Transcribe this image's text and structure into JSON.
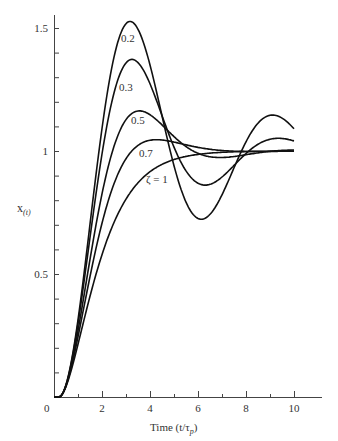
{
  "chart_data": {
    "type": "line",
    "title": "",
    "xlabel": "Time (t/τp)",
    "ylabel": "x(t)",
    "xlim": [
      0,
      11.5
    ],
    "ylim": [
      0,
      1.6
    ],
    "xticks": [
      0,
      2,
      4,
      6,
      8,
      10
    ],
    "xtick_labels": [
      "0",
      "2",
      "4",
      "6",
      "8",
      "10"
    ],
    "yticks": [
      0.5,
      1,
      1.5
    ],
    "ytick_labels": [
      "0.5",
      "1",
      "1.5"
    ],
    "grid": false,
    "legend": "inline labels",
    "series": [
      {
        "name": "0.2",
        "zeta": 0.2,
        "peak": 1.52,
        "peak_t": 3.0,
        "min": 0.72,
        "min_t": 6.3,
        "end_value": 1.14
      },
      {
        "name": "0.3",
        "zeta": 0.3,
        "peak": 1.38,
        "peak_t": 3.2,
        "min": 0.85,
        "min_t": 6.5,
        "end_value": 1.06
      },
      {
        "name": "0.5",
        "zeta": 0.5,
        "peak": 1.17,
        "peak_t": 3.3,
        "end_value": 1.01
      },
      {
        "name": "0.7",
        "zeta": 0.7,
        "peak": 1.05,
        "peak_t": 4.3,
        "end_value": 1.0
      },
      {
        "name": "ζ = 1",
        "zeta": 1.0,
        "end_value": 1.0
      }
    ],
    "x": [
      0,
      1,
      2,
      3,
      4,
      5,
      6,
      7,
      8,
      9,
      10
    ],
    "series_values": {
      "0.2": [
        0,
        0.4,
        1.15,
        1.52,
        1.35,
        0.95,
        0.73,
        0.8,
        1.05,
        1.18,
        1.14
      ],
      "0.3": [
        0,
        0.37,
        1.05,
        1.37,
        1.28,
        0.98,
        0.85,
        0.92,
        1.04,
        1.08,
        1.05
      ],
      "0.5": [
        0,
        0.33,
        0.9,
        1.15,
        1.12,
        1.03,
        0.99,
        1.0,
        1.01,
        1.01,
        1.01
      ],
      "0.7": [
        0,
        0.3,
        0.78,
        1.0,
        1.05,
        1.03,
        1.01,
        1.0,
        1.0,
        1.0,
        1.01
      ],
      "ζ = 1": [
        0,
        0.22,
        0.6,
        0.8,
        0.91,
        0.96,
        0.98,
        0.99,
        1.0,
        1.0,
        1.01
      ]
    }
  },
  "labels": {
    "ylabel_main": "x",
    "ylabel_sub": "(t)",
    "xlabel": "Time (t/τ",
    "xlabel_sub": "p",
    "xlabel_close": ")",
    "origin": "0",
    "curve_labels": [
      "0.2",
      "0.3",
      "0.5",
      "0.7",
      "ζ = 1"
    ]
  }
}
